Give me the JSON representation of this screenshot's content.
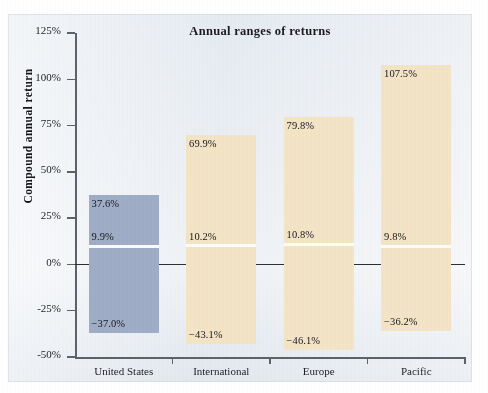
{
  "page": {
    "top_caption": "",
    "background_color": "#eaeef2"
  },
  "chart_data": {
    "type": "bar",
    "title": "Annual ranges of returns",
    "xlabel": "",
    "ylabel": "Compound annual return",
    "ylim": [
      -50,
      125
    ],
    "grid": false,
    "legend": "none",
    "y_ticks": [
      "125%",
      "100%",
      "75%",
      "50%",
      "25%",
      "0%",
      "-25%",
      "-50%"
    ],
    "y_tick_values": [
      125,
      100,
      75,
      50,
      25,
      0,
      -25,
      -50
    ],
    "categories": [
      "United States",
      "International",
      "Europe",
      "Pacific"
    ],
    "series": [
      {
        "name": "Best annual return",
        "values": [
          37.6,
          69.9,
          79.8,
          107.5
        ]
      },
      {
        "name": "Compound annual return",
        "values": [
          9.9,
          10.2,
          10.8,
          9.8
        ]
      },
      {
        "name": "Worst annual return",
        "values": [
          -37.0,
          -43.1,
          -46.1,
          -36.2
        ]
      }
    ],
    "bars": [
      {
        "category": "United States",
        "high": 37.6,
        "mid": 9.9,
        "low": -37.0,
        "high_label": "37.6%",
        "mid_label": "9.9%",
        "low_label": "−37.0%",
        "color": "#9fadc6"
      },
      {
        "category": "International",
        "high": 69.9,
        "mid": 10.2,
        "low": -43.1,
        "high_label": "69.9%",
        "mid_label": "10.2%",
        "low_label": "−43.1%",
        "color": "#f4e4c6"
      },
      {
        "category": "Europe",
        "high": 79.8,
        "mid": 10.8,
        "low": -46.1,
        "high_label": "79.8%",
        "mid_label": "10.8%",
        "low_label": "−46.1%",
        "color": "#f4e4c6"
      },
      {
        "category": "Pacific",
        "high": 107.5,
        "mid": 9.8,
        "low": -36.2,
        "high_label": "107.5%",
        "mid_label": "9.8%",
        "low_label": "−36.2%",
        "color": "#f4e4c6"
      }
    ],
    "colors": {
      "united_states_bar": "#9fadc6",
      "international_bar": "#f4e4c6",
      "divider_line": "#fbfbfb",
      "zero_line": "#2e2f33",
      "axis": "#5d626a",
      "text": "#17171c"
    }
  }
}
